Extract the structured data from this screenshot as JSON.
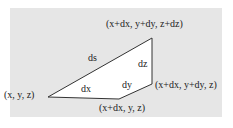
{
  "diagram": {
    "background": "#e6e6e6",
    "shape_fill": "#ffffff",
    "stroke": "#333333",
    "vertices": {
      "origin": "(x, y, z)",
      "bottom": "(x+dx, y, z)",
      "right": "(x+dx, y+dy, z)",
      "top": "(x+dx, y+dy, z+dz)"
    },
    "edges": {
      "ds": "ds",
      "dx": "dx",
      "dy": "dy",
      "dz": "dz"
    }
  }
}
